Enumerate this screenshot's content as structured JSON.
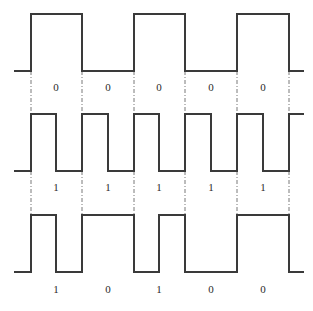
{
  "diagram": {
    "type": "digital-encoding-waveforms",
    "bit_boundaries_x": [
      31,
      82,
      134,
      185,
      237,
      289
    ],
    "rows": [
      {
        "name": "waveform-1",
        "high_y": 14,
        "low_y": 71,
        "label_y": 82,
        "bits": [
          "0",
          "0",
          "0",
          "0",
          "0"
        ],
        "path": "M14,71 L31,71 L31,14 L82,14 L82,71 L134,71 L134,14 L185,14 L185,71 L237,71 L237,14 L289,14 L289,71 L304,71"
      },
      {
        "name": "waveform-2",
        "high_y": 114,
        "low_y": 171,
        "label_y": 182,
        "bits": [
          "1",
          "1",
          "1",
          "1",
          "1"
        ],
        "path": "M14,171 L31,171 L31,114 L56,114 L56,171 L82,171 L82,114 L108,114 L108,171 L134,171 L134,114 L159,114 L159,171 L185,171 L185,114 L211,114 L211,171 L237,171 L237,114 L263,114 L263,171 L289,171 L289,114 L304,114"
      },
      {
        "name": "waveform-3",
        "high_y": 215,
        "low_y": 272,
        "label_y": 284,
        "bits": [
          "1",
          "0",
          "1",
          "0",
          "0"
        ],
        "path": "M14,272 L31,272 L31,215 L56,215 L56,272 L82,272 L82,215 L134,215 L134,272 L159,272 L159,215 L185,215 L185,272 L237,272 L237,215 L289,215 L289,272 L304,272"
      }
    ],
    "bit_centers_x": [
      56,
      108,
      159,
      211,
      263
    ],
    "guides": [
      {
        "y1": 71,
        "y2": 114
      },
      {
        "y1": 171,
        "y2": 215
      }
    ]
  }
}
